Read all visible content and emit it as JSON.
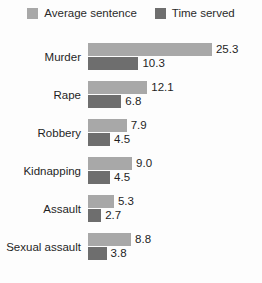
{
  "legend": {
    "entries": [
      {
        "label": "Average sentence",
        "color": "#a8a8a8",
        "swatch_name": "legend-swatch-average-sentence"
      },
      {
        "label": "Time served",
        "color": "#6e6e6e",
        "swatch_name": "legend-swatch-time-served"
      }
    ]
  },
  "chart_data": {
    "type": "bar",
    "orientation": "horizontal",
    "grouped": true,
    "title": "",
    "subtitle": "",
    "xlabel": "",
    "ylabel": "",
    "grid": false,
    "legend_position": "top-center",
    "categories": [
      "Murder",
      "Rape",
      "Robbery",
      "Kidnapping",
      "Assault",
      "Sexual assault"
    ],
    "series": [
      {
        "name": "Average sentence",
        "color": "#a8a8a8",
        "values": [
          25.3,
          12.1,
          7.9,
          9.0,
          5.3,
          8.8
        ],
        "labels": [
          "25.3",
          "12.1",
          "7.9",
          "9.0",
          "5.3",
          "8.8"
        ]
      },
      {
        "name": "Time served",
        "color": "#6e6e6e",
        "values": [
          10.3,
          6.8,
          4.5,
          4.5,
          2.7,
          3.8
        ],
        "labels": [
          "10.3",
          "6.8",
          "4.5",
          "4.5",
          "2.7",
          "3.8"
        ]
      }
    ],
    "xlim": [
      0,
      25.3
    ],
    "px_per_unit": 4.9
  },
  "groups": [
    {
      "category": "Murder",
      "upper": {
        "value": 25.3,
        "label": "25.3",
        "color": "#a8a8a8"
      },
      "lower": {
        "value": 10.3,
        "label": "10.3",
        "color": "#6e6e6e"
      }
    },
    {
      "category": "Rape",
      "upper": {
        "value": 12.1,
        "label": "12.1",
        "color": "#a8a8a8"
      },
      "lower": {
        "value": 6.8,
        "label": "6.8",
        "color": "#6e6e6e"
      }
    },
    {
      "category": "Robbery",
      "upper": {
        "value": 7.9,
        "label": "7.9",
        "color": "#a8a8a8"
      },
      "lower": {
        "value": 4.5,
        "label": "4.5",
        "color": "#6e6e6e"
      }
    },
    {
      "category": "Kidnapping",
      "upper": {
        "value": 9.0,
        "label": "9.0",
        "color": "#a8a8a8"
      },
      "lower": {
        "value": 4.5,
        "label": "4.5",
        "color": "#6e6e6e"
      }
    },
    {
      "category": "Assault",
      "upper": {
        "value": 5.3,
        "label": "5.3",
        "color": "#a8a8a8"
      },
      "lower": {
        "value": 2.7,
        "label": "2.7",
        "color": "#6e6e6e"
      }
    },
    {
      "category": "Sexual assault",
      "upper": {
        "value": 8.8,
        "label": "8.8",
        "color": "#a8a8a8"
      },
      "lower": {
        "value": 3.8,
        "label": "3.8",
        "color": "#6e6e6e"
      }
    }
  ]
}
